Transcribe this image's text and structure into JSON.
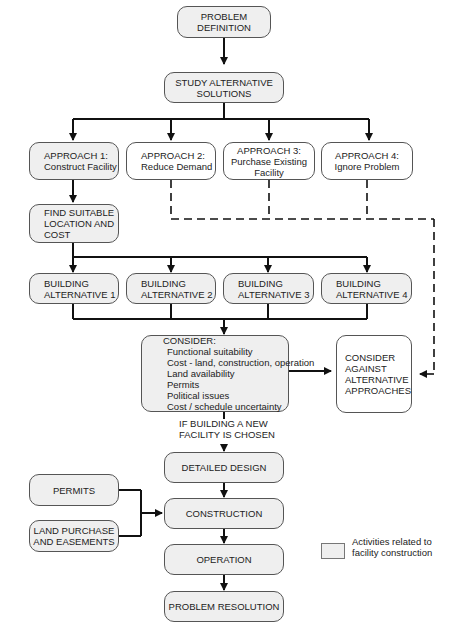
{
  "diagram": {
    "nodes": {
      "problem_definition": {
        "lines": [
          "PROBLEM",
          "DEFINITION"
        ]
      },
      "study_alternatives": {
        "lines": [
          "STUDY ALTERNATIVE",
          "SOLUTIONS"
        ]
      },
      "approach_1": {
        "lines": [
          "APPROACH 1:",
          "Construct Facility"
        ]
      },
      "approach_2": {
        "lines": [
          "APPROACH 2:",
          "Reduce Demand"
        ]
      },
      "approach_3": {
        "lines": [
          "APPROACH 3:",
          "Purchase Existing",
          "Facility"
        ]
      },
      "approach_4": {
        "lines": [
          "APPROACH 4:",
          "Ignore Problem"
        ]
      },
      "find_location": {
        "lines": [
          "FIND SUITABLE",
          "LOCATION AND",
          "COST"
        ]
      },
      "building_alt_1": {
        "lines": [
          "BUILDING",
          "ALTERNATIVE 1"
        ]
      },
      "building_alt_2": {
        "lines": [
          "BUILDING",
          "ALTERNATIVE 2"
        ]
      },
      "building_alt_3": {
        "lines": [
          "BUILDING",
          "ALTERNATIVE 3"
        ]
      },
      "building_alt_4": {
        "lines": [
          "BUILDING",
          "ALTERNATIVE 4"
        ]
      },
      "consider": {
        "title": "CONSIDER:",
        "items": [
          "Functional suitability",
          "Cost - land, construction, operation",
          "Land availability",
          "Permits",
          "Political issues",
          "Cost / schedule uncertainty"
        ]
      },
      "consider_against": {
        "lines": [
          "CONSIDER",
          "AGAINST",
          "ALTERNATIVE",
          "APPROACHES"
        ]
      },
      "detailed_design": {
        "lines": [
          "DETAILED DESIGN"
        ]
      },
      "permits": {
        "lines": [
          "PERMITS"
        ]
      },
      "construction": {
        "lines": [
          "CONSTRUCTION"
        ]
      },
      "land_purchase": {
        "lines": [
          "LAND PURCHASE",
          "AND EASEMENTS"
        ]
      },
      "operation": {
        "lines": [
          "OPERATION"
        ]
      },
      "problem_resolution": {
        "lines": [
          "PROBLEM RESOLUTION"
        ]
      }
    },
    "edge_labels": {
      "new_facility": [
        "IF BUILDING A NEW",
        "FACILITY IS CHOSEN"
      ]
    },
    "legend": {
      "lines": [
        "Activities related to",
        "facility construction"
      ],
      "swatch_color": "#efefef"
    },
    "colors": {
      "shaded_fill": "#efefef",
      "line": "#111111",
      "border": "#555555"
    }
  }
}
